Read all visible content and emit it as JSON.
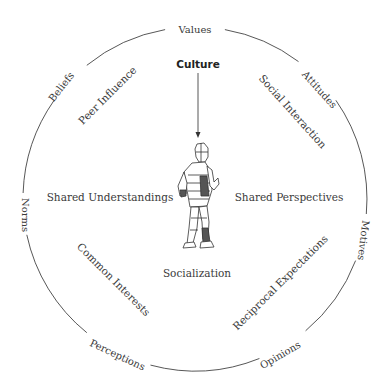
{
  "diagram": {
    "center_concept": "Culture",
    "outer_ring_labels": [
      "Values",
      "Attitudes",
      "Motives",
      "Opinions",
      "Perceptions",
      "Norms",
      "Beliefs"
    ],
    "inner_labels": {
      "peer_influence": "Peer Influence",
      "social_interaction": "Social Interaction",
      "shared_understandings": "Shared Understandings",
      "shared_perspectives": "Shared Perspectives",
      "common_interests": "Common Interests",
      "socialization": "Socialization",
      "reciprocal_expectations": "Reciprocal Expectations"
    },
    "figure": "walking-person-figure"
  }
}
